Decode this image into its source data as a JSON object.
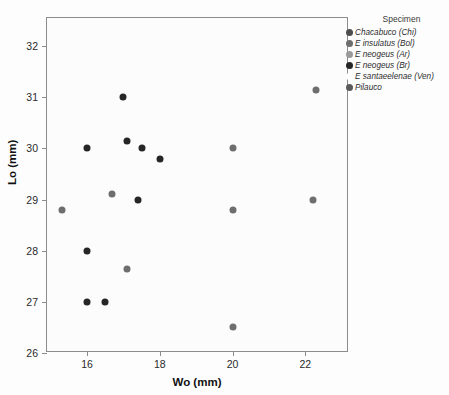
{
  "chart_data": {
    "type": "scatter",
    "title": "",
    "xlabel": "Wo (mm)",
    "ylabel": "Lo (mm)",
    "xlim": [
      14.9,
      23.2
    ],
    "ylim": [
      26,
      32.55
    ],
    "xticks": [
      16,
      18,
      20,
      22
    ],
    "yticks": [
      26,
      27,
      28,
      29,
      30,
      31,
      32
    ],
    "grid": false,
    "legend_position": "right",
    "legend_title": "Specimen",
    "series": [
      {
        "name": "Chacabuco (Chi)",
        "color": "#4d4d4d",
        "points": []
      },
      {
        "name": "E. insulatus (Bol)",
        "color": "#6e6e6e",
        "points": [
          {
            "x": 15.3,
            "y": 28.8
          },
          {
            "x": 16.7,
            "y": 29.1
          },
          {
            "x": 17.1,
            "y": 27.65
          },
          {
            "x": 20.0,
            "y": 26.5
          },
          {
            "x": 20.0,
            "y": 28.8
          },
          {
            "x": 20.0,
            "y": 30.0
          },
          {
            "x": 22.2,
            "y": 29.0
          },
          {
            "x": 22.3,
            "y": 31.15
          }
        ]
      },
      {
        "name": "E. neogeus (Ar)",
        "color": "#9a9a9a",
        "points": []
      },
      {
        "name": "E. neogeus (Br)",
        "color": "#262626",
        "points": [
          {
            "x": 16.0,
            "y": 30.0
          },
          {
            "x": 16.0,
            "y": 28.0
          },
          {
            "x": 16.0,
            "y": 27.0
          },
          {
            "x": 16.5,
            "y": 27.0
          },
          {
            "x": 17.0,
            "y": 31.0
          },
          {
            "x": 17.1,
            "y": 30.15
          },
          {
            "x": 17.4,
            "y": 29.0
          },
          {
            "x": 17.5,
            "y": 30.0
          },
          {
            "x": 18.0,
            "y": 29.8
          }
        ]
      },
      {
        "name": "E. santaeelenae (Ven)",
        "color": "#ffffff",
        "points": []
      },
      {
        "name": "Pilauco",
        "color": "#5a5a5a",
        "points": []
      }
    ]
  },
  "axes": {
    "y_title": "Lo (mm)",
    "x_title": "Wo (mm)",
    "y_tick_labels": [
      "26",
      "27",
      "28",
      "29",
      "30",
      "31",
      "32"
    ],
    "x_tick_labels": [
      "16",
      "18",
      "20",
      "22"
    ]
  },
  "legend": {
    "title": "Specimen",
    "items": [
      {
        "label": "Chacabuco (Chi)",
        "color": "#4d4d4d"
      },
      {
        "label": "E  insulatus (Bol)",
        "color": "#6e6e6e"
      },
      {
        "label": "E  neogeus (Ar)",
        "color": "#9a9a9a"
      },
      {
        "label": "E  neogeus (Br)",
        "color": "#262626"
      },
      {
        "label": "E  santaeelenae (Ven)",
        "color": "#ffffff"
      },
      {
        "label": "Pilauco",
        "color": "#5a5a5a"
      }
    ]
  }
}
